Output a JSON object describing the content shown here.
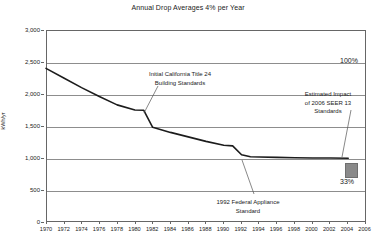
{
  "chart_data": {
    "type": "line",
    "title": "Annual Drop Averages 4% per Year",
    "xlabel": "",
    "ylabel": "kWh/yr",
    "xlim": [
      1970,
      2006
    ],
    "ylim": [
      0,
      3000
    ],
    "grid": true,
    "legend_position": "none",
    "y_ticks": [
      "3,000",
      "2,500",
      "2,000",
      "1,500",
      "1,000",
      "500",
      "0"
    ],
    "y_tick_values": [
      3000,
      2500,
      2000,
      1500,
      1000,
      500,
      0
    ],
    "x_ticks": [
      "1970",
      "1972",
      "1974",
      "1976",
      "1978",
      "1980",
      "1982",
      "1984",
      "1986",
      "1988",
      "1990",
      "1992",
      "1994",
      "1996",
      "1998",
      "2000",
      "2002",
      "2004",
      "2006"
    ],
    "x_tick_values": [
      1970,
      1972,
      1974,
      1976,
      1978,
      1980,
      1982,
      1984,
      1986,
      1988,
      1990,
      1992,
      1994,
      1996,
      1998,
      2000,
      2002,
      2004,
      2006
    ],
    "series": [
      {
        "name": "Average annual refrigerator energy use",
        "color": "#1c1c1c",
        "x": [
          1970,
          1972,
          1974,
          1976,
          1978,
          1980,
          1981,
          1982,
          1984,
          1986,
          1988,
          1990,
          1991,
          1992,
          1993,
          1994,
          1996,
          1998,
          2000,
          2002,
          2004
        ],
        "values": [
          2400,
          2250,
          2100,
          1960,
          1830,
          1750,
          1745,
          1480,
          1400,
          1330,
          1260,
          1200,
          1190,
          1050,
          1020,
          1015,
          1010,
          1005,
          1000,
          1000,
          995
        ]
      }
    ],
    "annotations": [
      {
        "id": "title24",
        "text_lines": [
          "Initial California Title 24",
          "Building Standards"
        ],
        "points_to_year": 1981,
        "points_to_value": 1745
      },
      {
        "id": "seer13",
        "text_lines": [
          "Estimated Impact",
          "of 2006 SEER 13",
          "Standards"
        ],
        "points_to_year": 2005,
        "points_to_value": 800
      },
      {
        "id": "federal-appliance",
        "text_lines": [
          "1992 Federal Appliance",
          "Standard"
        ],
        "points_to_year": 1992,
        "points_to_value": 1050
      }
    ],
    "callout_values": {
      "baseline_percent": "100%",
      "reduced_percent": "33%",
      "marker_color": "#8a8a8a"
    }
  },
  "axis": {
    "y_title": "kWh/yr"
  }
}
